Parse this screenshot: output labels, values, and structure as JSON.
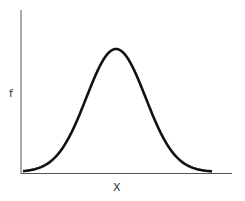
{
  "chart_data": {
    "type": "line",
    "title": "",
    "xlabel": "X",
    "ylabel": "f",
    "series": [
      {
        "name": "bell curve",
        "shape": "normal distribution",
        "mean_position": "center",
        "color": "#000000"
      }
    ],
    "x": [
      -3,
      -2.5,
      -2,
      -1.5,
      -1,
      -0.5,
      0,
      0.5,
      1,
      1.5,
      2,
      2.5,
      3
    ],
    "values": [
      0.011,
      0.044,
      0.135,
      0.325,
      0.607,
      0.882,
      1.0,
      0.882,
      0.607,
      0.325,
      0.135,
      0.044,
      0.011
    ],
    "grid": false,
    "legend": "none"
  },
  "axes": {
    "x_label": "X",
    "y_label": "f"
  }
}
